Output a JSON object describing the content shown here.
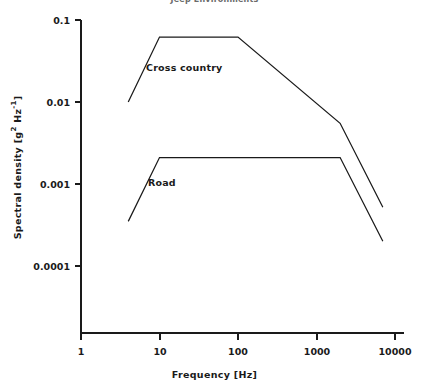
{
  "figure": {
    "title": "Jeep Environments",
    "width": 429,
    "height": 392,
    "background": "#ffffff",
    "line_color": "#1a1a1a"
  },
  "axes": {
    "x": {
      "title": "Frequency [Hz]",
      "scale": "log",
      "min": 1,
      "max": 10000,
      "ticks": [
        "1",
        "10",
        "100",
        "1000",
        "10000"
      ],
      "tick_values": [
        1,
        10,
        100,
        1000,
        10000
      ]
    },
    "y": {
      "title_main": "Spectral density [g",
      "title_sup1": "2",
      "title_mid": " Hz",
      "title_sup2": "-1",
      "title_end": "]",
      "title_plain": "Spectral density [g2 Hz-1]",
      "scale": "log",
      "min": 0.0001,
      "max": 0.1,
      "ticks": [
        "0.1",
        "0.01",
        "0.001",
        "0.0001"
      ],
      "tick_values": [
        0.1,
        0.01,
        0.001,
        0.0001
      ]
    }
  },
  "series_labels": {
    "cross_country": "Cross country",
    "road": "Road"
  },
  "chart_data": {
    "type": "line",
    "title": "Jeep Environments",
    "xlabel": "Frequency [Hz]",
    "ylabel": "Spectral density [g^2 Hz^-1]",
    "xscale": "log",
    "yscale": "log",
    "xlim": [
      1,
      10000
    ],
    "ylim": [
      0.0001,
      0.1
    ],
    "grid": false,
    "legend": "inline-annotations",
    "series": [
      {
        "name": "Cross country",
        "x": [
          4,
          10,
          100,
          2000,
          7000
        ],
        "y": [
          0.01,
          0.062,
          0.062,
          0.0055,
          0.00052
        ]
      },
      {
        "name": "Road",
        "x": [
          4,
          10,
          2000,
          7000
        ],
        "y": [
          0.00035,
          0.0021,
          0.0021,
          0.0002
        ]
      }
    ]
  }
}
